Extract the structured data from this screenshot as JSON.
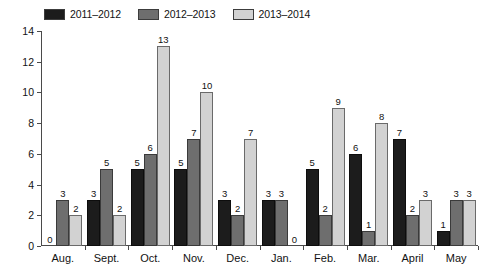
{
  "chart_data": {
    "type": "bar",
    "title": "",
    "subtitle": "",
    "xlabel": "",
    "ylabel": "",
    "ylim": [
      0,
      14
    ],
    "y_ticks": [
      0,
      2,
      4,
      6,
      8,
      10,
      12,
      14
    ],
    "grid": false,
    "legend_position": "top-left",
    "categories": [
      "Aug.",
      "Sept.",
      "Oct.",
      "Nov.",
      "Dec.",
      "Jan.",
      "Feb.",
      "Mar.",
      "April",
      "May"
    ],
    "series": [
      {
        "name": "2011–2012",
        "color": "#1c1c1c",
        "values": [
          0,
          3,
          5,
          5,
          3,
          3,
          5,
          6,
          7,
          1
        ]
      },
      {
        "name": "2012–2013",
        "color": "#6e6e6e",
        "values": [
          3,
          5,
          6,
          7,
          2,
          3,
          2,
          1,
          2,
          3
        ]
      },
      {
        "name": "2013–2014",
        "color": "#d2d2d2",
        "values": [
          2,
          2,
          13,
          10,
          7,
          0,
          9,
          8,
          3,
          3
        ]
      }
    ],
    "data_labels_shown": true
  },
  "legend": {
    "items": [
      {
        "label": "2011–2012",
        "swatch": "#1c1c1c"
      },
      {
        "label": "2012–2013",
        "swatch": "#6e6e6e"
      },
      {
        "label": "2013–2014",
        "swatch": "#d2d2d2"
      }
    ]
  },
  "axes": {
    "y_tick_labels": [
      "0",
      "2",
      "4",
      "6",
      "8",
      "10",
      "12",
      "14"
    ],
    "x_tick_labels": [
      "Aug.",
      "Sept.",
      "Oct.",
      "Nov.",
      "Dec.",
      "Jan.",
      "Feb.",
      "Mar.",
      "April",
      "May"
    ]
  },
  "colors": {
    "axis": "#4a4a4a",
    "text": "#121212",
    "background": "#ffffff"
  }
}
